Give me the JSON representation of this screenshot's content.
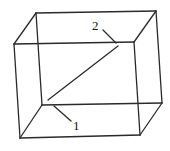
{
  "diagram": {
    "type": "wireframe-box",
    "stroke_color": "#2a2a2a",
    "vertices": {
      "front_top_left": [
        14,
        44
      ],
      "front_top_right": [
        134,
        42
      ],
      "front_bottom_left": [
        20,
        138
      ],
      "front_bottom_right": [
        140,
        135
      ],
      "back_top_left": [
        36,
        13
      ],
      "back_top_right": [
        156,
        11
      ],
      "back_bottom_left": [
        42,
        105
      ],
      "back_bottom_right": [
        162,
        103
      ]
    },
    "diagonal": {
      "from": [
        48,
        100
      ],
      "to": [
        118,
        46
      ]
    },
    "labels": [
      {
        "id": "label-1",
        "text": "1",
        "x": 73,
        "y": 130,
        "leader_from": [
          54,
          106
        ],
        "leader_to": [
          71,
          121
        ]
      },
      {
        "id": "label-2",
        "text": "2",
        "x": 92,
        "y": 30,
        "leader_from": [
          103,
          30
        ],
        "leader_to": [
          116,
          43
        ]
      }
    ]
  }
}
